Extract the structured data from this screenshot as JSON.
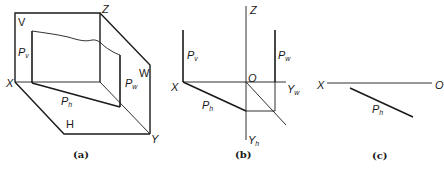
{
  "panels": [
    {
      "id": "a",
      "caption": "(a)",
      "labels": {
        "V": "V",
        "Z": "Z",
        "X": "X",
        "W": "W",
        "H": "H",
        "Y": "Y",
        "Pv": "P",
        "Pv_sub": "v",
        "Pw": "P",
        "Pw_sub": "w",
        "Ph": "P",
        "Ph_sub": "h"
      }
    },
    {
      "id": "b",
      "caption": "(b)",
      "labels": {
        "Z": "Z",
        "X": "X",
        "O": "O",
        "Yw": "Y",
        "Yw_sub": "w",
        "Yh": "Y",
        "Yh_sub": "h",
        "Pv": "P",
        "Pv_sub": "v",
        "Pw": "P",
        "Pw_sub": "w",
        "Ph": "P",
        "Ph_sub": "h"
      }
    },
    {
      "id": "c",
      "caption": "(c)",
      "labels": {
        "X": "X",
        "O": "O",
        "Ph": "P",
        "Ph_sub": "h"
      }
    }
  ],
  "colors": {
    "line": "#1a1a1a",
    "background": "#ffffff"
  }
}
